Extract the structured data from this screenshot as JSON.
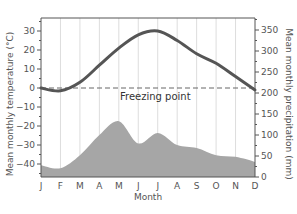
{
  "chart_data": {
    "type": "line+area",
    "title": "",
    "xlabel": "Month",
    "ylabel_left": "Mean monthly temperature (°C)",
    "ylabel_right": "Mean monthly precipitation (mm)",
    "categories": [
      "J",
      "F",
      "M",
      "A",
      "M",
      "J",
      "J",
      "A",
      "S",
      "O",
      "N",
      "D"
    ],
    "series": [
      {
        "name": "Mean monthly temperature",
        "type": "line",
        "axis": "left",
        "unit": "°C",
        "color": "#555555",
        "values": [
          0,
          -1.5,
          3,
          12,
          21,
          28,
          30,
          25,
          18,
          13,
          6,
          -1
        ]
      },
      {
        "name": "Mean monthly precipitation",
        "type": "area",
        "axis": "right",
        "unit": "mm",
        "color": "#a6a6a6",
        "values": [
          28,
          21,
          52,
          100,
          133,
          80,
          105,
          76,
          69,
          52,
          48,
          36
        ]
      }
    ],
    "left_axis": {
      "ticks": [
        30,
        20,
        10,
        0,
        -10,
        -20,
        -30,
        -40
      ],
      "range": [
        -46,
        37
      ]
    },
    "right_axis": {
      "ticks": [
        350,
        300,
        250,
        200,
        150,
        100,
        50,
        0
      ],
      "range": [
        0,
        378
      ]
    },
    "annotations": [
      {
        "text": "Freezing point",
        "type": "dashed-hline",
        "y": 0,
        "axis": "left"
      }
    ],
    "grid": {
      "vertical": true,
      "horizontal": false
    }
  }
}
